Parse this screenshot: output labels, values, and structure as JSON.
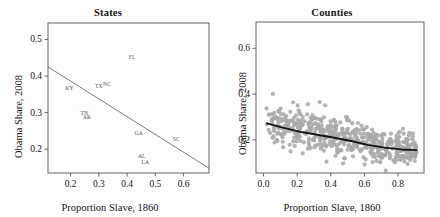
{
  "figure": {
    "background": "#fdfdfd",
    "frame_color": "#555555",
    "text_color": "#141414"
  },
  "chart_data": [
    {
      "type": "scatter",
      "title": "States",
      "xlabel": "Proportion Slave, 1860",
      "ylabel": "Obama Share, 2008",
      "xlim": [
        0.12,
        0.69
      ],
      "ylim": [
        0.135,
        0.545
      ],
      "xticks": [
        "0.2",
        "0.3",
        "0.4",
        "0.5",
        "0.6"
      ],
      "xtick_values": [
        0.2,
        0.3,
        0.4,
        0.5,
        0.6
      ],
      "yticks": [
        "0.2",
        "0.3",
        "0.4",
        "0.5"
      ],
      "ytick_values": [
        0.2,
        0.3,
        0.4,
        0.5
      ],
      "grid": false,
      "legend": "none",
      "marker_style": "text-label",
      "label_color": "#555555",
      "points": [
        {
          "label": "FL",
          "x": 0.418,
          "y": 0.451
        },
        {
          "label": "KY",
          "x": 0.196,
          "y": 0.366
        },
        {
          "label": "TX",
          "x": 0.3,
          "y": 0.374
        },
        {
          "label": "NC",
          "x": 0.329,
          "y": 0.377
        },
        {
          "label": "TN",
          "x": 0.249,
          "y": 0.3
        },
        {
          "label": "AR",
          "x": 0.258,
          "y": 0.287
        },
        {
          "label": "GA",
          "x": 0.441,
          "y": 0.245
        },
        {
          "label": "SC",
          "x": 0.574,
          "y": 0.228
        },
        {
          "label": "AL",
          "x": 0.452,
          "y": 0.182
        },
        {
          "label": "LA",
          "x": 0.465,
          "y": 0.164
        }
      ],
      "fit_line": {
        "type": "linear",
        "color": "#666666",
        "x_start": 0.12,
        "y_start": 0.425,
        "x_end": 0.69,
        "y_end": 0.148
      }
    },
    {
      "type": "scatter",
      "title": "Counties",
      "xlabel": "Proportion Slave, 1860",
      "ylabel": "Obama Share, 2008",
      "xlim": [
        -0.045,
        0.955
      ],
      "ylim": [
        0.055,
        0.715
      ],
      "xticks": [
        "0.0",
        "0.2",
        "0.4",
        "0.6",
        "0.8"
      ],
      "xtick_values": [
        0.0,
        0.2,
        0.4,
        0.6,
        0.8
      ],
      "yticks": [
        "0.2",
        "0.4",
        "0.6"
      ],
      "ytick_values": [
        0.2,
        0.4,
        0.6
      ],
      "grid": false,
      "legend": "none",
      "marker_style": "filled-circle",
      "marker_color": "#a9a9a9",
      "marker_size": 2.1,
      "n_points": 520,
      "fit_line": {
        "type": "loess",
        "color": "#141414",
        "width": 1.9,
        "x": [
          0.02,
          0.12,
          0.22,
          0.32,
          0.42,
          0.52,
          0.62,
          0.72,
          0.82,
          0.91
        ],
        "y": [
          0.272,
          0.252,
          0.235,
          0.222,
          0.209,
          0.195,
          0.178,
          0.166,
          0.158,
          0.155
        ]
      }
    }
  ]
}
